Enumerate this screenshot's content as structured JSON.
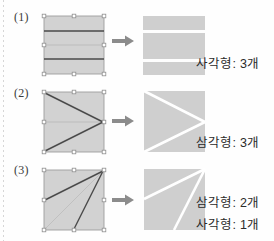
{
  "page": {
    "background_color": "#fefefe",
    "fill_color": "#d2d2d2",
    "fill_color_result": "#cfcfcf",
    "cut_line_color": "#4a4a4a",
    "guide_line_color": "#b0b0b0",
    "divider_color": "#ffffff",
    "arrow_color": "#8c8c8c",
    "handle_color": "#9a9a9a",
    "text_color": "#2b2b2b"
  },
  "rows": [
    {
      "id": "row-1",
      "label": "(1)",
      "arrow_icon": "right-arrow-icon",
      "source": {
        "name": "square-with-horizontal-cuts",
        "shape": "square",
        "cuts": [
          {
            "type": "horizontal",
            "y_fraction": 0.27
          },
          {
            "type": "horizontal",
            "y_fraction": 0.73
          }
        ],
        "guides": [
          {
            "type": "horizontal",
            "y_fraction": 0.5
          }
        ],
        "handles": 8
      },
      "result": {
        "name": "three-horizontal-bands",
        "pieces": 3,
        "piece_shape": "rectangle"
      },
      "captions": [
        {
          "name": "rectangle-count-label",
          "text": "사각형: 3개",
          "shape": "사각형",
          "count": 3,
          "unit": "개"
        }
      ]
    },
    {
      "id": "row-2",
      "label": "(2)",
      "arrow_icon": "right-arrow-icon",
      "source": {
        "name": "square-with-chevron-cuts",
        "shape": "square",
        "cuts": [
          {
            "type": "diagonal",
            "from": "top-left",
            "to": "right-middle"
          },
          {
            "type": "diagonal",
            "from": "bottom-left",
            "to": "right-middle"
          }
        ],
        "guides": [
          {
            "type": "horizontal",
            "y_fraction": 0.5
          }
        ],
        "handles": 8
      },
      "result": {
        "name": "three-triangles",
        "pieces": 3,
        "piece_shape": "triangle"
      },
      "captions": [
        {
          "name": "triangle-count-label",
          "text": "삼각형: 3개",
          "shape": "삼각형",
          "count": 3,
          "unit": "개"
        }
      ]
    },
    {
      "id": "row-3",
      "label": "(3)",
      "arrow_icon": "right-arrow-icon",
      "source": {
        "name": "square-with-fan-cuts",
        "shape": "square",
        "cuts": [
          {
            "type": "diagonal",
            "from": "top-right",
            "to": "left-middle"
          },
          {
            "type": "diagonal",
            "from": "top-right",
            "to": "bottom-middle"
          }
        ],
        "guides": [
          {
            "type": "diagonal",
            "from": "top-right",
            "to": "bottom-left"
          }
        ],
        "handles": 8
      },
      "result": {
        "name": "two-triangles-one-quadrilateral",
        "pieces": 3,
        "piece_shape": "mixed"
      },
      "captions": [
        {
          "name": "triangle-count-label",
          "text": "삼각형: 2개",
          "shape": "삼각형",
          "count": 2,
          "unit": "개"
        },
        {
          "name": "rectangle-count-label",
          "text": "사각형: 1개",
          "shape": "사각형",
          "count": 1,
          "unit": "개"
        }
      ]
    }
  ]
}
